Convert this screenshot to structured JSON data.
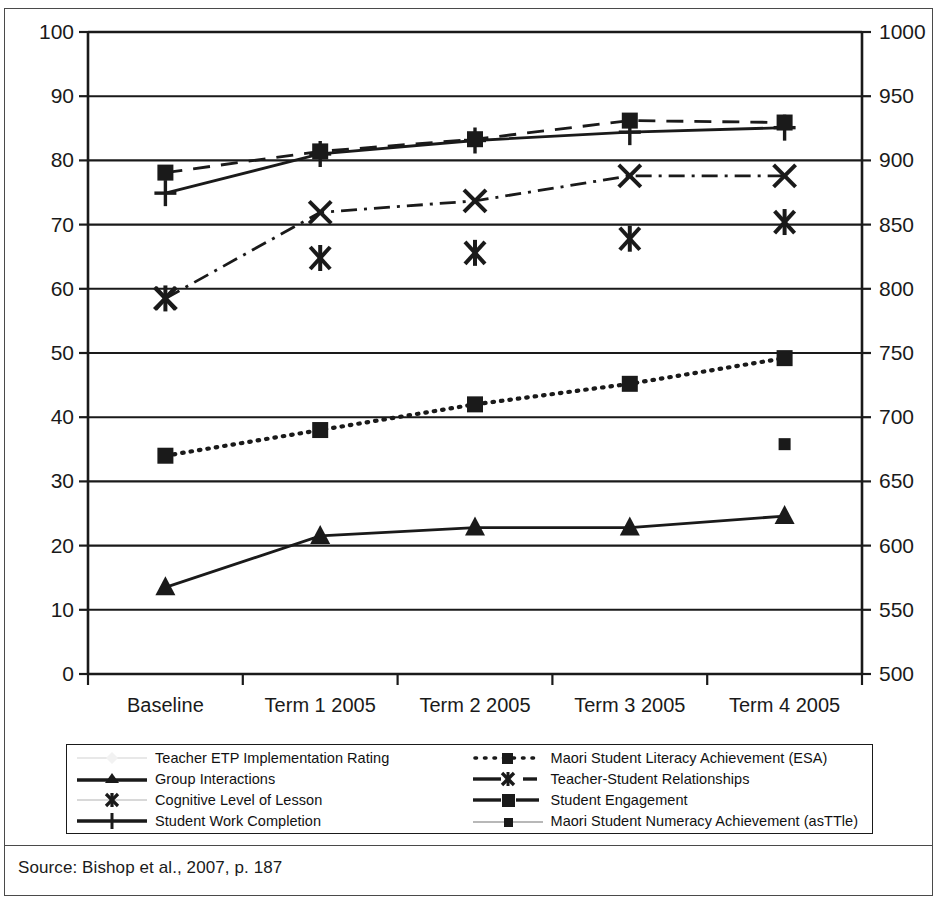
{
  "source": {
    "text": "Source: Bishop et al., 2007, p. 187"
  },
  "legend": {
    "items": [
      {
        "id": "teacher-etp",
        "label": "Teacher ETP Implementation Rating",
        "key": "faint-line-diamond"
      },
      {
        "id": "group-interactions",
        "label": "Group Interactions",
        "key": "solid-line-triangle"
      },
      {
        "id": "cognitive-level",
        "label": "Cognitive Level of Lesson",
        "key": "faint-line-star"
      },
      {
        "id": "work-completion",
        "label": "Student Work Completion",
        "key": "solid-line-plus"
      },
      {
        "id": "literacy-esa",
        "label": "Maori Student Literacy Achievement (ESA)",
        "key": "dotted-line-square"
      },
      {
        "id": "relationships",
        "label": "Teacher-Student Relationships",
        "key": "dashdot-line-x"
      },
      {
        "id": "engagement",
        "label": "Student Engagement",
        "key": "dashed-line-square"
      },
      {
        "id": "numeracy-asttle",
        "label": "Maori Student Numeracy Achievement (asTTle)",
        "key": "faint-line-smallsquare"
      }
    ]
  },
  "chart_data": {
    "type": "line",
    "title": "",
    "xlabel": "",
    "categories": [
      "Baseline",
      "Term 1 2005",
      "Term 2 2005",
      "Term 3 2005",
      "Term 4 2005"
    ],
    "grid": true,
    "legend_position": "bottom",
    "axes": {
      "left": {
        "label": "",
        "ylim": [
          0,
          100
        ],
        "ticks": [
          0,
          10,
          20,
          30,
          40,
          50,
          60,
          70,
          80,
          90,
          100
        ],
        "tick_labels": [
          "0",
          "10",
          "20",
          "30",
          "40",
          "50",
          "60",
          "70",
          "80",
          "90",
          "100"
        ]
      },
      "right": {
        "label": "",
        "ylim": [
          500,
          1000
        ],
        "ticks": [
          500,
          550,
          600,
          650,
          700,
          750,
          800,
          850,
          900,
          950,
          1000
        ],
        "tick_labels": [
          "500",
          "550",
          "600",
          "650",
          "700",
          "750",
          "800",
          "850",
          "900",
          "950",
          "1000"
        ]
      }
    },
    "series": [
      {
        "name": "Teacher ETP Implementation Rating",
        "axis": "left",
        "style": "faint",
        "marker": "diamond",
        "values": [
          null,
          null,
          null,
          null,
          null
        ]
      },
      {
        "name": "Group Interactions",
        "axis": "left",
        "style": "solid",
        "marker": "triangle",
        "values": [
          13.5,
          21.5,
          22.8,
          22.8,
          24.6
        ]
      },
      {
        "name": "Cognitive Level of Lesson",
        "axis": "left",
        "style": "markers-only",
        "marker": "star",
        "values": [
          58.5,
          64.8,
          65.6,
          67.8,
          70.4
        ]
      },
      {
        "name": "Student Work Completion",
        "axis": "left",
        "style": "solid",
        "marker": "plus",
        "values": [
          74.9,
          81.0,
          83.1,
          84.4,
          85.1
        ]
      },
      {
        "name": "Maori Student Literacy Achievement (ESA)",
        "axis": "right",
        "style": "dotted",
        "marker": "square",
        "values": [
          670,
          690,
          710,
          726,
          746
        ]
      },
      {
        "name": "Teacher-Student Relationships",
        "axis": "left",
        "style": "dashdot",
        "marker": "x",
        "values": [
          58.5,
          71.9,
          73.7,
          77.6,
          77.6
        ]
      },
      {
        "name": "Student Engagement",
        "axis": "left",
        "style": "dashed",
        "marker": "square",
        "values": [
          78.1,
          81.4,
          83.3,
          86.2,
          85.9
        ]
      },
      {
        "name": "Maori Student Numeracy Achievement (asTTle)",
        "axis": "right",
        "style": "faint",
        "marker": "small-square",
        "values": [
          null,
          null,
          null,
          null,
          679
        ]
      }
    ]
  }
}
